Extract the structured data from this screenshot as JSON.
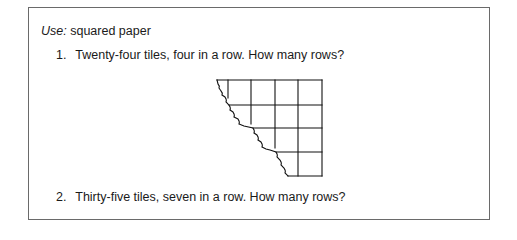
{
  "header": {
    "use_label": "Use:",
    "use_value": "squared paper"
  },
  "questions": [
    {
      "number": "1.",
      "text": "Twenty-four tiles, four in a row. How many rows?"
    },
    {
      "number": "2.",
      "text": "Thirty-five tiles, seven in a row. How many rows?"
    }
  ],
  "diagram": {
    "columns_visible": 5,
    "rows_visible": 4,
    "line_color": "#111111"
  }
}
